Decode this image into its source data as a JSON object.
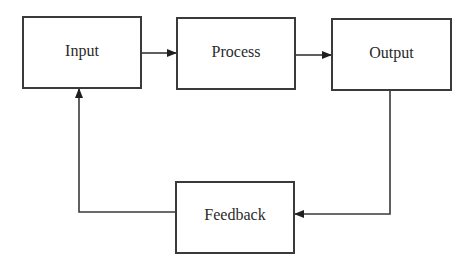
{
  "diagram": {
    "type": "flowchart",
    "nodes": [
      {
        "id": "input",
        "label": "Input"
      },
      {
        "id": "process",
        "label": "Process"
      },
      {
        "id": "output",
        "label": "Output"
      },
      {
        "id": "feedback",
        "label": "Feedback"
      }
    ],
    "edges": [
      {
        "from": "input",
        "to": "process"
      },
      {
        "from": "process",
        "to": "output"
      },
      {
        "from": "output",
        "to": "feedback"
      },
      {
        "from": "feedback",
        "to": "input"
      }
    ],
    "colors": {
      "stroke": "#3a3a3a",
      "text": "#2a2a2a",
      "background": "#ffffff"
    }
  }
}
